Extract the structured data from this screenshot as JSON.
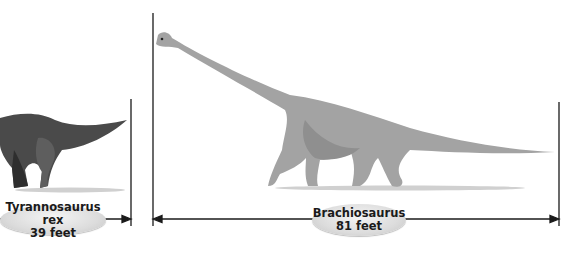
{
  "diagram": {
    "colors": {
      "trex_body": "#4a4a4a",
      "trex_shadow": "#2e2e2e",
      "brachio_body": "#a3a3a3",
      "brachio_shadow": "#8a8a8a",
      "ground": "#c8c8c8",
      "measure_line": "#1a1a1a",
      "label_fill": "#dcdcdc"
    },
    "dinosaurs": [
      {
        "name": "Tyrannosaurus rex",
        "length": "39 feet",
        "length_feet": 39
      },
      {
        "name": "Brachiosaurus",
        "length": "81 feet",
        "length_feet": 81
      }
    ]
  }
}
